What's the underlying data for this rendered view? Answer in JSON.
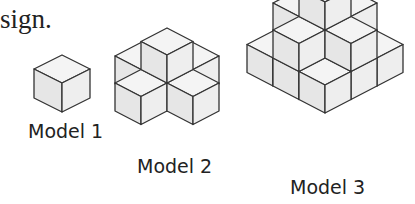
{
  "header_fragment": "sign.",
  "models": [
    {
      "label": "Model 1",
      "cubes": 1
    },
    {
      "label": "Model 2",
      "cubes": 5
    },
    {
      "label": "Model 3",
      "cubes": 14
    }
  ],
  "colors": {
    "stroke": "#333333",
    "top": "#f4f4f4",
    "left": "#e6e6e6",
    "right": "#eeeeee"
  }
}
